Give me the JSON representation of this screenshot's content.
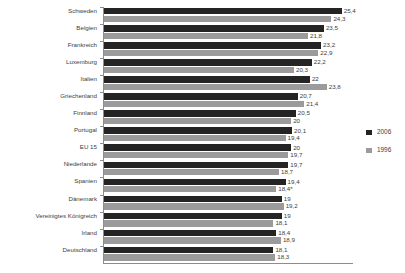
{
  "chart_data": {
    "type": "bar",
    "orientation": "horizontal",
    "title": "",
    "xlabel": "",
    "ylabel": "",
    "grid": false,
    "legend_position": "right",
    "xlim": [
      0,
      26.5
    ],
    "categories": [
      "Schweden",
      "Belgien",
      "Frankreich",
      "Luxemburg",
      "Italien",
      "Griechenland",
      "Finnland",
      "Portugal",
      "EU 15",
      "Niederlande",
      "Spanien",
      "Dänemark",
      "Vereinigtes Königreich",
      "Irland",
      "Deutschland"
    ],
    "series": [
      {
        "name": "2006",
        "color": "#242424",
        "values": [
          25.4,
          23.5,
          23.2,
          22.2,
          22,
          20.7,
          20.5,
          20.1,
          20,
          19.7,
          19.4,
          19,
          19,
          18.4,
          18.1
        ],
        "labels": [
          "25,4",
          "23,5",
          "23,2",
          "22,2",
          "22",
          "20,7",
          "20,5",
          "20,1",
          "20",
          "19,7",
          "19,4",
          "19",
          "19",
          "18,4",
          "18,1"
        ]
      },
      {
        "name": "1996",
        "color": "#9b9b9b",
        "values": [
          24.3,
          21.8,
          22.9,
          20.3,
          23.8,
          21.4,
          20,
          19.4,
          19.7,
          18.7,
          18.4,
          19.2,
          18.1,
          18.9,
          18.3
        ],
        "labels": [
          "24,3",
          "21,8",
          "22,9",
          "20,3",
          "23,8",
          "21,4",
          "20",
          "19,4",
          "19,7",
          "18,7",
          "18,4*",
          "19,2",
          "18,1",
          "18,9",
          "18,3"
        ]
      }
    ]
  },
  "legend": {
    "items": [
      {
        "label": "2006"
      },
      {
        "label": "1996"
      }
    ]
  },
  "footnote": {
    "text": ""
  }
}
